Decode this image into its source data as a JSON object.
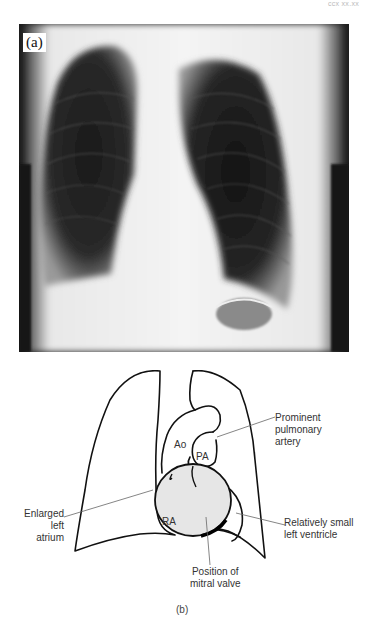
{
  "page": {
    "header_text": "ccx xx.xx"
  },
  "figure": {
    "panel_a": {
      "label": "(a)",
      "content": "Chest X-ray (posteroanterior view)"
    },
    "panel_b": {
      "label": "(b)",
      "content": "Schematic line drawing of heart and lungs",
      "annotations": {
        "ao": "Ao",
        "pa": "PA",
        "ra": "RA",
        "prominent_pa": [
          "Prominent",
          "pulmonary",
          "artery"
        ],
        "enlarged_la": [
          "Enlarged",
          "left atrium"
        ],
        "small_lv": [
          "Relatively small",
          "left ventricle"
        ],
        "mitral_valve": [
          "Position of",
          "mitral valve"
        ]
      },
      "colors": {
        "left_atrium_fill": "#e6e6e6",
        "outline": "#111111"
      }
    }
  }
}
